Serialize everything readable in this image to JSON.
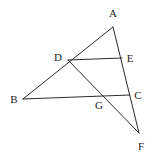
{
  "figure": {
    "type": "line-diagram",
    "width": 152,
    "height": 161,
    "background_color": "#ffffff",
    "line_color": "#2b2b2b",
    "label_color": "#1d1d1d",
    "points": [
      {
        "id": "A",
        "label": "A",
        "x": 113,
        "y": 27,
        "label_x": 113,
        "label_y": 13
      },
      {
        "id": "B",
        "label": "B",
        "x": 23,
        "y": 99,
        "label_x": 14,
        "label_y": 99
      },
      {
        "id": "C",
        "label": "C",
        "x": 130,
        "y": 95,
        "label_x": 138,
        "label_y": 95
      },
      {
        "id": "D",
        "label": "D",
        "x": 68,
        "y": 60,
        "label_x": 58,
        "label_y": 57
      },
      {
        "id": "E",
        "label": "E",
        "x": 122,
        "y": 58,
        "label_x": 130,
        "label_y": 58
      },
      {
        "id": "F",
        "label": "F",
        "x": 139,
        "y": 133,
        "label_x": 141,
        "label_y": 146
      },
      {
        "id": "G",
        "label": "G",
        "x": 106,
        "y": 96,
        "label_x": 99,
        "label_y": 105
      }
    ],
    "segments": [
      {
        "id": "AB",
        "name": "segment-a-b",
        "from": "A",
        "to": "B",
        "passes_through": [
          "D"
        ]
      },
      {
        "id": "AF",
        "name": "segment-a-f",
        "from": "A",
        "to": "F",
        "passes_through": [
          "E",
          "C"
        ]
      },
      {
        "id": "DE",
        "name": "segment-d-e",
        "from": "D",
        "to": "E",
        "passes_through": []
      },
      {
        "id": "BC",
        "name": "segment-b-c",
        "from": "B",
        "to": "C",
        "passes_through": [
          "G"
        ]
      },
      {
        "id": "DF",
        "name": "segment-d-f",
        "from": "D",
        "to": "F",
        "passes_through": [
          "G"
        ]
      }
    ]
  }
}
